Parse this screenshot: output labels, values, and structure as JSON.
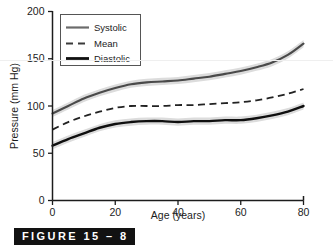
{
  "figure": {
    "caption": "FIGURE 15 – 8",
    "caption_bar_color": "#121212",
    "caption_text_color": "#ffffff"
  },
  "chart_data": {
    "type": "line",
    "title": "",
    "xlabel": "Age (years)",
    "ylabel": "Pressure (mm Hg)",
    "xlim": [
      0,
      80
    ],
    "ylim": [
      0,
      200
    ],
    "xticks": [
      0,
      20,
      40,
      60,
      80
    ],
    "yticks": [
      0,
      50,
      100,
      150,
      200
    ],
    "xtick_labels": [
      "0",
      "20",
      "40",
      "60",
      "80"
    ],
    "ytick_labels": [
      "0",
      "50",
      "100",
      "150",
      "200"
    ],
    "grid": false,
    "legend_position": "upper-left",
    "x": [
      0,
      5,
      10,
      15,
      20,
      25,
      30,
      35,
      40,
      45,
      50,
      55,
      60,
      65,
      70,
      75,
      80
    ],
    "series": [
      {
        "name": "Systolic",
        "style": "solid",
        "color": "#4a4a4a",
        "band_color": "#d9d9d9",
        "values": [
          92,
          100,
          108,
          114,
          119,
          123,
          125,
          126,
          127,
          129,
          131,
          134,
          137,
          141,
          146,
          154,
          166
        ]
      },
      {
        "name": "Mean",
        "style": "dashed",
        "color": "#222222",
        "band_color": "",
        "values": [
          75,
          83,
          89,
          94,
          98,
          100,
          100,
          100,
          101,
          101,
          102,
          103,
          104,
          106,
          109,
          113,
          118
        ]
      },
      {
        "name": "Diastolic",
        "style": "solid",
        "color": "#0f0f0f",
        "band_color": "#d9d9d9",
        "values": [
          58,
          65,
          71,
          77,
          81,
          83,
          84,
          84,
          83,
          84,
          84,
          85,
          85,
          87,
          90,
          94,
          100
        ]
      }
    ]
  },
  "legend": {
    "items": [
      {
        "label": "Systolic"
      },
      {
        "label": "Mean"
      },
      {
        "label": "Diastolic"
      }
    ]
  }
}
